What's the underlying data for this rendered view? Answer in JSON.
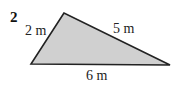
{
  "problem_number": "2",
  "triangle": {
    "vertices": {
      "top": [
        64,
        13
      ],
      "bottom_left": [
        31,
        64
      ],
      "bottom_right": [
        170,
        65
      ]
    },
    "fill": "#d0d0d0",
    "stroke": "#222222",
    "sides": {
      "left": "2 m",
      "right": "5 m",
      "bottom": "6 m"
    }
  }
}
